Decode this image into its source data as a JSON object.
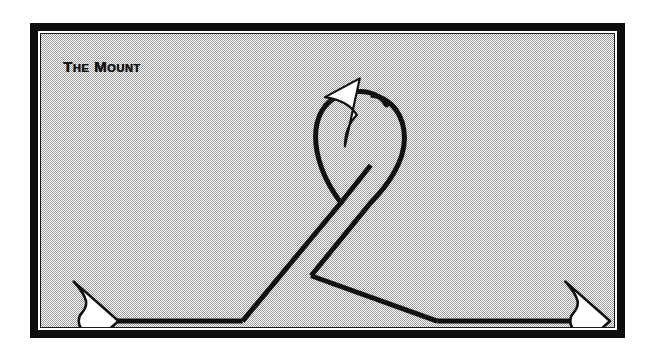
{
  "page": {
    "background_color": "#ffffff",
    "width": 655,
    "height": 361
  },
  "frame": {
    "border_color": "#0d0d0d",
    "inner_line_color": "#ffffff",
    "fill_pattern": "50-percent-checkerboard-dither",
    "fill_color": "#9a9a9a",
    "fill_base_color": "#ffffff"
  },
  "figure": {
    "title": "The Mount",
    "title_color": "#141414",
    "stroke_color": "#101010",
    "arrowhead_fill": "#ffffff",
    "arrowhead_stroke": "#101010",
    "path_points": {
      "left_arrow_tip_x": 105,
      "left_vertex_x": 232,
      "left_vertex_y": 303,
      "crossing_x": 331,
      "crossing_y": 183,
      "loop_apex_x": 331,
      "loop_apex_y": 88,
      "loop_left_x": 303,
      "loop_right_x": 360,
      "right_vertex_x": 428,
      "right_vertex_y": 303,
      "right_arrow_tip_x": 600,
      "loop_arrow_tip_x": 348,
      "loop_arrow_tip_y": 68
    }
  }
}
